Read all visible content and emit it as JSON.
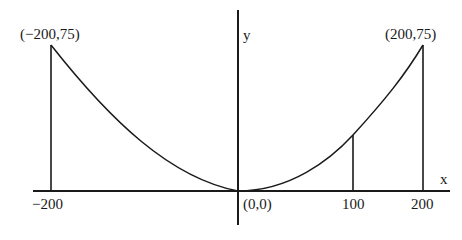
{
  "diagram": {
    "type": "parabola-on-axes",
    "axes": {
      "x_label": "x",
      "y_label": "y"
    },
    "points": {
      "left_endpoint": "(−200,75)",
      "right_endpoint": "(200,75)",
      "origin": "(0,0)"
    },
    "x_ticks": [
      "−200",
      "100",
      "200"
    ],
    "vertical_segments_at_x": [
      -200,
      100,
      200
    ],
    "curve": {
      "equation_shape": "upward parabola through (0,0), (-200,75), (200,75)"
    },
    "colors": {
      "ink": "#1a1a1a",
      "background": "#ffffff"
    }
  }
}
